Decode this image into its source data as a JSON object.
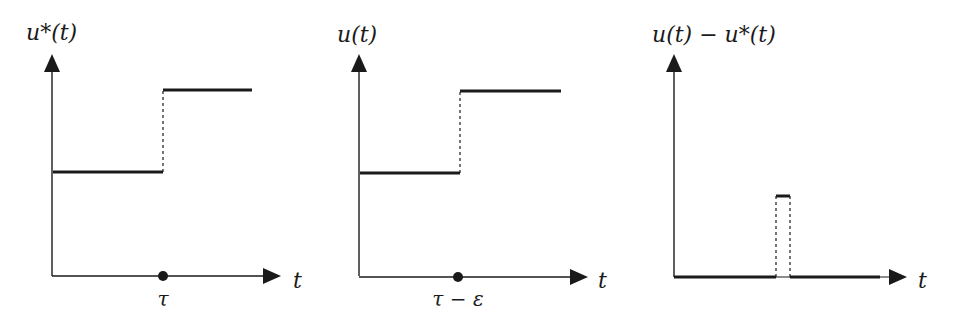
{
  "panels": [
    {
      "id": "optimal-control",
      "y_label": "u*(t)",
      "x_label": "t",
      "tick_label": "τ",
      "low_level_start": 0,
      "jump_at": "τ",
      "description": "Step function u*(t): low level, jump at τ to high level"
    },
    {
      "id": "perturbed-control",
      "y_label": "u(t)",
      "x_label": "t",
      "tick_label": "τ − ε",
      "jump_at": "τ − ε",
      "description": "Step function u(t): same levels, jump shifted earlier to τ − ε"
    },
    {
      "id": "difference",
      "y_label": "u(t) − u*(t)",
      "x_label": "t",
      "description": "Difference: zero except a narrow rectangular pulse on [τ − ε, τ]"
    }
  ],
  "colors": {
    "line": "#1a1a1a",
    "background": "#ffffff"
  }
}
